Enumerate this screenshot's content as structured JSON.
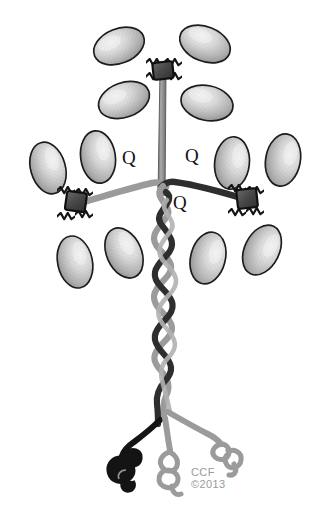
{
  "figure": {
    "background_color": "#ffffff",
    "width": 332,
    "height": 507,
    "labels": {
      "q_left": "Q",
      "q_right": "Q",
      "q_center": "Q"
    },
    "watermark": {
      "line1": "CCF",
      "line2": "©2013",
      "color": "#9a9a9a"
    },
    "colors": {
      "domain_fill_light": "#e9e9e9",
      "domain_fill_mid": "#b4b4b4",
      "domain_fill_dark": "#8d8d8d",
      "domain_outline": "#1c1c1c",
      "hinge_block": "#4a4a4a",
      "hinge_outline": "#111111",
      "stem_gray": "#8c8c8c",
      "strand_dark": "#2b2b2b",
      "strand_gray": "#9b9b9b",
      "tail_black": "#141414",
      "tail_gray": "#9b9b9b"
    },
    "icon_names": {
      "globular_domain": "ellipse-domain-icon",
      "hinge": "hinge-block-icon",
      "helix": "coiled-coil-helix-icon",
      "tail": "squiggle-tail-icon"
    },
    "domains": {
      "top_cluster_count": 4,
      "left_cluster_count": 4,
      "right_cluster_count": 4,
      "total_count": 12
    },
    "hinges": {
      "count": 3,
      "positions": [
        "top",
        "left",
        "right"
      ]
    },
    "tails": {
      "count": 3,
      "descriptions": [
        "black-squiggle-left",
        "gray-squiggle-center",
        "gray-squiggle-right"
      ]
    }
  }
}
